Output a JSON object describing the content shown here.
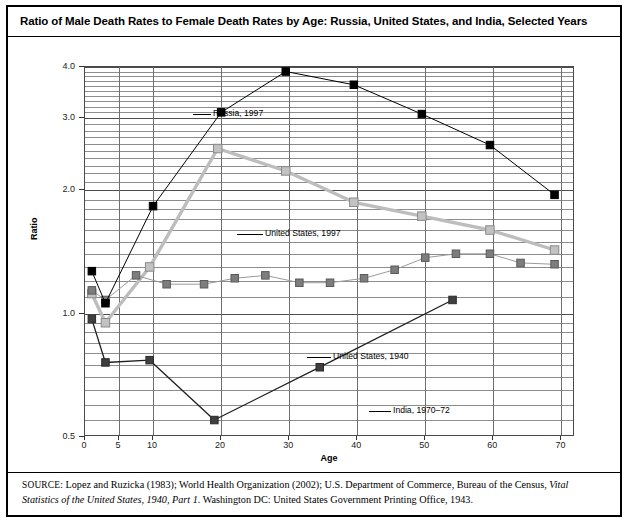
{
  "title": "Ratio of Male Death Rates to Female Death Rates by Age: Russia, United States, and India, Selected Years",
  "axis": {
    "x_title": "Age",
    "y_title": "Ratio",
    "x_ticks": [
      "0",
      "5",
      "10",
      "20",
      "30",
      "40",
      "50",
      "60",
      "70"
    ],
    "y_ticks": [
      "0.5",
      "1.0",
      "2.0",
      "3.0",
      "4.0"
    ]
  },
  "annotations": {
    "russia": "Russia, 1997",
    "us1997": "United States, 1997",
    "us1940": "United States, 1940",
    "india": "India, 1970–72"
  },
  "source": {
    "label": "SOURCE:",
    "text_1": " Lopez and Ruzicka (1983); World Health Organization (2002); U.S. Department of Commerce, Bureau of the Census, ",
    "italic_1": "Vital Statistics of the United States, 1940, Part 1",
    "text_2": ". Washington DC: United States Government Printing Office, 1943."
  },
  "chart_data": {
    "type": "line",
    "title": "Ratio of Male Death Rates to Female Death Rates by Age: Russia, United States, and India, Selected Years",
    "xlabel": "Age",
    "ylabel": "Ratio",
    "xlim": [
      0,
      72
    ],
    "ylim": [
      0.5,
      4.0
    ],
    "yscale": "log",
    "grid": true,
    "legend": "inline-annotations",
    "xticks": [
      0,
      5,
      10,
      20,
      30,
      40,
      50,
      60,
      70
    ],
    "yticks": [
      0.5,
      1.0,
      2.0,
      3.0,
      4.0
    ],
    "series": [
      {
        "name": "Russia, 1997",
        "color": "#000000",
        "marker": "filled-square",
        "points": [
          {
            "x": 1,
            "y": 1.27
          },
          {
            "x": 3,
            "y": 1.06
          },
          {
            "x": 10,
            "y": 1.83
          },
          {
            "x": 20,
            "y": 3.1
          },
          {
            "x": 29.5,
            "y": 3.9
          },
          {
            "x": 39.5,
            "y": 3.62
          },
          {
            "x": 49.5,
            "y": 3.07
          },
          {
            "x": 59.5,
            "y": 2.58
          },
          {
            "x": 69,
            "y": 1.95
          }
        ]
      },
      {
        "name": "United States, 1997",
        "color": "#b3b3b3",
        "marker": "light-square",
        "points": [
          {
            "x": 1,
            "y": 1.12
          },
          {
            "x": 3,
            "y": 0.95
          },
          {
            "x": 9.5,
            "y": 1.3
          },
          {
            "x": 19.5,
            "y": 2.53
          },
          {
            "x": 29.5,
            "y": 2.23
          },
          {
            "x": 39.5,
            "y": 1.87
          },
          {
            "x": 49.5,
            "y": 1.73
          },
          {
            "x": 59.5,
            "y": 1.6
          },
          {
            "x": 69,
            "y": 1.43
          }
        ]
      },
      {
        "name": "United States, 1940",
        "color": "#7a7a7a",
        "marker": "grey-square",
        "points": [
          {
            "x": 1,
            "y": 1.14
          },
          {
            "x": 3,
            "y": 1.08
          },
          {
            "x": 7.5,
            "y": 1.24
          },
          {
            "x": 12,
            "y": 1.18
          },
          {
            "x": 17.5,
            "y": 1.18
          },
          {
            "x": 22,
            "y": 1.22
          },
          {
            "x": 26.5,
            "y": 1.24
          },
          {
            "x": 31.5,
            "y": 1.19
          },
          {
            "x": 36,
            "y": 1.19
          },
          {
            "x": 41,
            "y": 1.22
          },
          {
            "x": 45.5,
            "y": 1.28
          },
          {
            "x": 50,
            "y": 1.37
          },
          {
            "x": 54.5,
            "y": 1.4
          },
          {
            "x": 59.5,
            "y": 1.4
          },
          {
            "x": 64,
            "y": 1.33
          },
          {
            "x": 69,
            "y": 1.32
          }
        ]
      },
      {
        "name": "India, 1970–72",
        "color": "#3b3b3b",
        "marker": "dark-square",
        "points": [
          {
            "x": 1,
            "y": 0.97
          },
          {
            "x": 3,
            "y": 0.76
          },
          {
            "x": 9.5,
            "y": 0.77
          },
          {
            "x": 19,
            "y": 0.55
          },
          {
            "x": 34.5,
            "y": 0.74
          },
          {
            "x": 54,
            "y": 1.08
          }
        ]
      }
    ]
  }
}
